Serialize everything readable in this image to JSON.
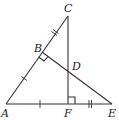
{
  "diagram": {
    "type": "geometry",
    "points": {
      "A": {
        "label": "A",
        "x": 6,
        "y": 104
      },
      "B": {
        "label": "B",
        "x": 42,
        "y": 52
      },
      "C": {
        "label": "C",
        "x": 68,
        "y": 16
      },
      "D": {
        "label": "D",
        "x": 68,
        "y": 70
      },
      "E": {
        "label": "E",
        "x": 112,
        "y": 104
      },
      "F": {
        "label": "F",
        "x": 68,
        "y": 104
      }
    },
    "segments": [
      "AC",
      "AE",
      "CF",
      "BE"
    ],
    "right_angles": [
      "ABD",
      "CFE"
    ],
    "congruence_marks": [
      {
        "segments": [
          "AB",
          "AF"
        ],
        "ticks": 1
      },
      {
        "segments": [
          "BC",
          "FE"
        ],
        "ticks": 2
      }
    ],
    "labels": {
      "A": "A",
      "B": "B",
      "C": "C",
      "D": "D",
      "E": "E",
      "F": "F"
    }
  }
}
